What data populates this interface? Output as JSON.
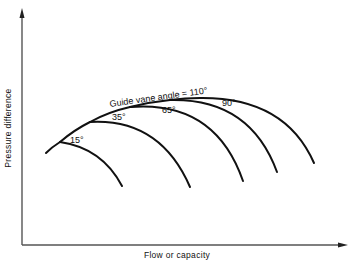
{
  "diagram": {
    "title": "",
    "x_axis_label": "Flow or capacity",
    "y_axis_label": "Pressure difference",
    "curve_label_prefix": "Guide vane angle = 110°",
    "curves": [
      {
        "angle": "15°"
      },
      {
        "angle": "35°"
      },
      {
        "angle": "65°"
      },
      {
        "angle": "90°"
      },
      {
        "angle": "110°"
      }
    ],
    "labels": {
      "c15": "15°",
      "c35": "35°",
      "c65": "65°",
      "c90": "90°",
      "c110": "Guide vane angle = 110°"
    }
  }
}
